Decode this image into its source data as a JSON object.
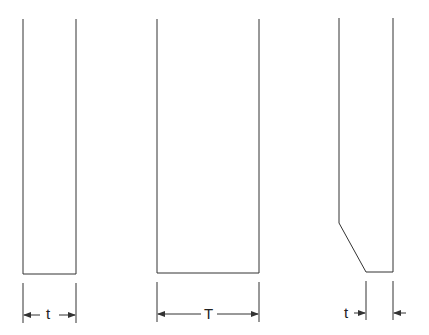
{
  "diagram": {
    "figures": [
      {
        "id": "thin-plate",
        "dimension_label": "t"
      },
      {
        "id": "thick-plate",
        "dimension_label": "T"
      },
      {
        "id": "chamfered-plate",
        "dimension_label": "t"
      }
    ],
    "colors": {
      "line": "#333333",
      "background": "#ffffff"
    }
  }
}
